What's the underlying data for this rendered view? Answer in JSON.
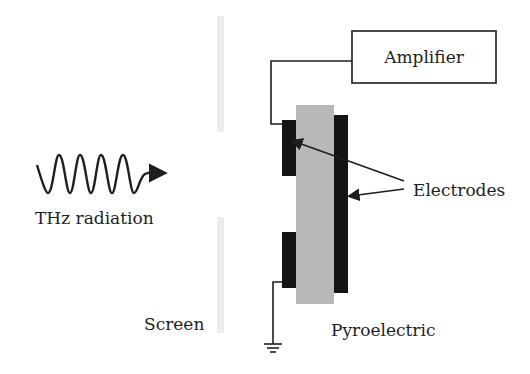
{
  "diagram": {
    "labels": {
      "amplifier": "Amplifier",
      "electrodes": "Electrodes",
      "thz_radiation": "THz radiation",
      "screen": "Screen",
      "pyroelectric": "Pyroelectric"
    },
    "colors": {
      "stroke": "#1e1e1e",
      "electrode": "#141414",
      "pyroelectric": "#b8b8b8",
      "screen": "#ececec",
      "background": "#ffffff"
    },
    "components": [
      {
        "id": "thz-wave",
        "type": "wave-arrow"
      },
      {
        "id": "screen",
        "type": "slit-screen",
        "segments": 2
      },
      {
        "id": "pyroelectric-crystal",
        "type": "block"
      },
      {
        "id": "electrode-front-top",
        "type": "electrode"
      },
      {
        "id": "electrode-front-bottom",
        "type": "electrode"
      },
      {
        "id": "electrode-back",
        "type": "electrode"
      },
      {
        "id": "amplifier",
        "type": "box"
      },
      {
        "id": "ground",
        "type": "ground-symbol"
      }
    ]
  }
}
